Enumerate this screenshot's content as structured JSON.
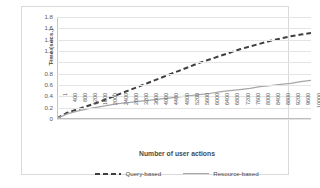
{
  "chart_data": {
    "type": "line",
    "title": "",
    "xlabel": "Number of user actions",
    "ylabel": "Time (secs.)",
    "ylim": [
      0,
      1.8
    ],
    "ytick_labels": [
      "1.8",
      "1.6",
      "1.4",
      "1.2",
      "1",
      "0.8",
      "0.6",
      "0.4",
      "0.2",
      "0"
    ],
    "ytick_values": [
      1.8,
      1.6,
      1.4,
      1.2,
      1.0,
      0.8,
      0.6,
      0.4,
      0.2,
      0
    ],
    "grid": true,
    "legend_position": "bottom",
    "categories": [
      "1",
      "400",
      "800",
      "1200",
      "1600",
      "2000",
      "2400",
      "2800",
      "3200",
      "3600",
      "4000",
      "4400",
      "4800",
      "5200",
      "5600",
      "6000",
      "6400",
      "6800",
      "7200",
      "7600",
      "8000",
      "8400",
      "8800",
      "9200",
      "9600",
      "10000"
    ],
    "x": [
      1,
      400,
      800,
      1200,
      1600,
      2000,
      2400,
      2800,
      3200,
      3600,
      4000,
      4400,
      4800,
      5200,
      5600,
      6000,
      6400,
      6800,
      7200,
      7600,
      8000,
      8400,
      8800,
      9200,
      9600,
      10000
    ],
    "series": [
      {
        "name": "Query-based",
        "style": "dashed",
        "color": "#3f3f3f",
        "values": [
          0.01,
          0.11,
          0.17,
          0.23,
          0.29,
          0.36,
          0.43,
          0.5,
          0.57,
          0.64,
          0.71,
          0.78,
          0.85,
          0.92,
          0.99,
          1.05,
          1.11,
          1.17,
          1.23,
          1.28,
          1.33,
          1.38,
          1.42,
          1.46,
          1.49,
          1.52
        ]
      },
      {
        "name": "Resource-based",
        "style": "solid",
        "color": "#a6a6a6",
        "values": [
          0.01,
          0.09,
          0.14,
          0.18,
          0.21,
          0.24,
          0.27,
          0.29,
          0.31,
          0.33,
          0.35,
          0.37,
          0.39,
          0.41,
          0.43,
          0.45,
          0.48,
          0.5,
          0.52,
          0.54,
          0.57,
          0.59,
          0.61,
          0.63,
          0.66,
          0.68
        ]
      }
    ]
  },
  "legend": {
    "items": [
      {
        "label": "Query-based"
      },
      {
        "label": "Resource-based"
      }
    ]
  }
}
